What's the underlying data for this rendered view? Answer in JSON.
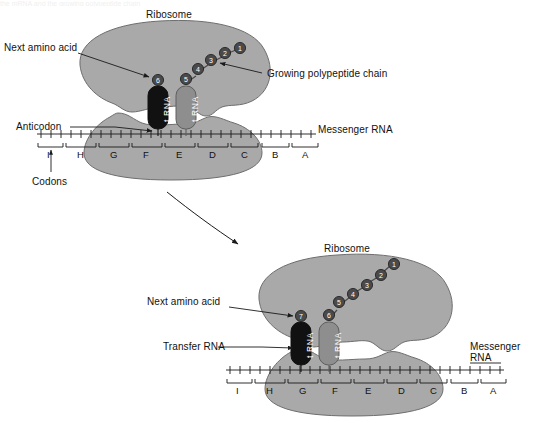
{
  "figure": {
    "title_fragment_top": "the mRNA and the growing polypeptide chain",
    "background_color": "#ffffff",
    "ribosome_color": "#a9a9a9",
    "ribosome_stroke": "#6e6e6e",
    "trna_dark_color": "#111111",
    "trna_light_color": "#8e8e8e",
    "amino_acid_color": "#4a4a4a",
    "line_color": "#1a1a1a"
  },
  "panels": [
    {
      "id": "upper",
      "labels": {
        "ribosome": "Ribosome",
        "next_amino_acid": "Next amino acid",
        "growing_chain": "Growing polypeptide chain",
        "anticodon": "Anticodon",
        "codons": "Codons",
        "messenger_rna": "Messenger RNA"
      },
      "trna": [
        {
          "id": "dark",
          "text": "t RNA",
          "amino_acid": "6",
          "shade": "dark"
        },
        {
          "id": "light",
          "text": "t RNA",
          "amino_acid": "5",
          "shade": "light"
        }
      ],
      "polypeptide_chain": [
        "5",
        "4",
        "3",
        "2",
        "1"
      ],
      "codons": [
        "I",
        "H",
        "G",
        "F",
        "E",
        "D",
        "C",
        "B",
        "A"
      ]
    },
    {
      "id": "lower",
      "labels": {
        "ribosome": "Ribosome",
        "next_amino_acid": "Next amino acid",
        "transfer_rna": "Transfer RNA",
        "messenger_rna_line1": "Messenger",
        "messenger_rna_line2": "RNA"
      },
      "trna": [
        {
          "id": "dark",
          "text": "t RNA",
          "amino_acid": "7",
          "shade": "dark"
        },
        {
          "id": "light",
          "text": "t RNA",
          "amino_acid": "6",
          "shade": "light"
        }
      ],
      "polypeptide_chain": [
        "6",
        "5",
        "4",
        "3",
        "2",
        "1"
      ],
      "codons": [
        "I",
        "H",
        "G",
        "F",
        "E",
        "D",
        "C",
        "B",
        "A"
      ]
    }
  ],
  "transition_arrow": {
    "name": "step-transition-arrow",
    "description": "curved arrow from upper panel to lower panel"
  }
}
